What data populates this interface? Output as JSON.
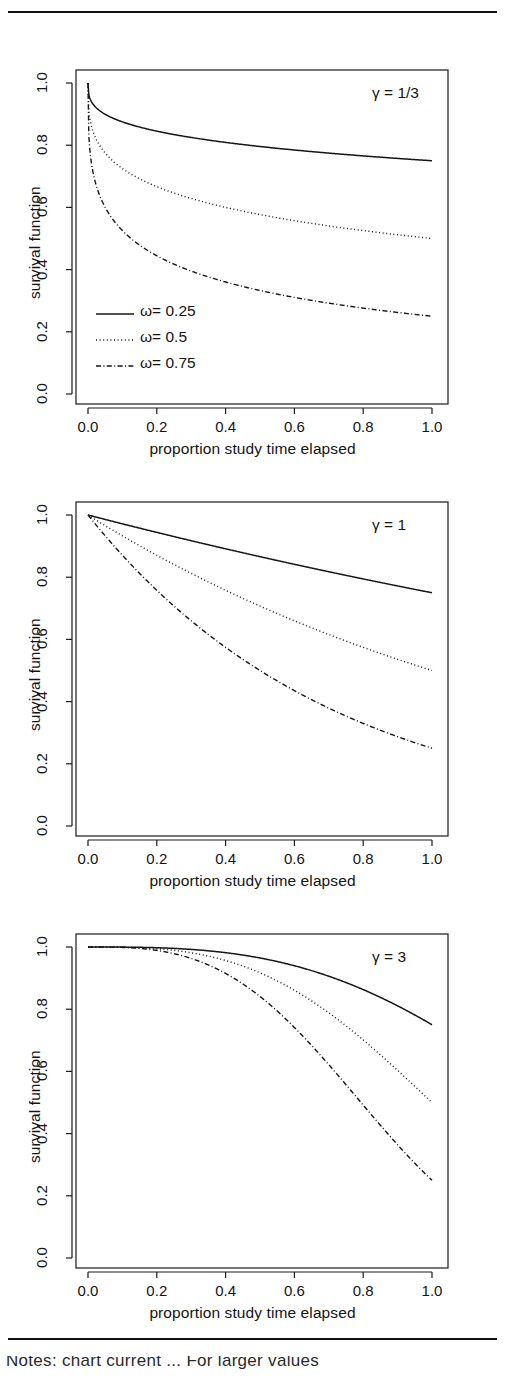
{
  "figure": {
    "panel_count": 3,
    "top_rule": "—",
    "bottom_rule": "—",
    "caption_fragment": "Notes: chart current ... For larger values"
  },
  "axes": {
    "xlabel": "proportion study time elapsed",
    "ylabel": "survival function",
    "xticks": [
      "0.0",
      "0.2",
      "0.4",
      "0.6",
      "0.8",
      "1.0"
    ],
    "yticks": [
      "0.0",
      "0.2",
      "0.4",
      "0.6",
      "0.8",
      "1.0"
    ]
  },
  "legend": {
    "entries": [
      {
        "label": "ω= 0.25",
        "style": "solid"
      },
      {
        "label": "ω= 0.5",
        "style": "dotted"
      },
      {
        "label": "ω= 0.75",
        "style": "dashdot"
      }
    ]
  },
  "panels": [
    {
      "annotation": "γ = 1/3",
      "gamma": 0.3333
    },
    {
      "annotation": "γ = 1",
      "gamma": 1
    },
    {
      "annotation": "γ = 3",
      "gamma": 3
    }
  ],
  "chart_data": [
    {
      "type": "line",
      "title": "γ = 1/3",
      "xlabel": "proportion study time elapsed",
      "ylabel": "survival function",
      "xlim": [
        0,
        1
      ],
      "ylim": [
        0,
        1
      ],
      "grid": false,
      "legend_position": "bottom-left",
      "x": [
        0,
        0.01,
        0.02,
        0.05,
        0.1,
        0.15,
        0.2,
        0.3,
        0.4,
        0.5,
        0.6,
        0.7,
        0.8,
        0.9,
        1.0
      ],
      "series": [
        {
          "name": "ω= 0.25",
          "style": "solid",
          "values": [
            1.0,
            0.941,
            0.927,
            0.905,
            0.884,
            0.871,
            0.861,
            0.846,
            0.834,
            0.824,
            0.815,
            0.807,
            0.8,
            0.794,
            0.75
          ]
        },
        {
          "name": "ω= 0.5",
          "style": "dotted",
          "values": [
            1.0,
            0.861,
            0.827,
            0.777,
            0.729,
            0.7,
            0.678,
            0.645,
            0.62,
            0.6,
            0.582,
            0.566,
            0.553,
            0.54,
            0.5
          ]
        },
        {
          "name": "ω= 0.75",
          "style": "dashdot",
          "values": [
            1.0,
            0.737,
            0.678,
            0.593,
            0.516,
            0.47,
            0.437,
            0.388,
            0.352,
            0.323,
            0.298,
            0.277,
            0.258,
            0.241,
            0.25
          ]
        }
      ]
    },
    {
      "type": "line",
      "title": "γ = 1",
      "xlabel": "proportion study time elapsed",
      "ylabel": "survival function",
      "xlim": [
        0,
        1
      ],
      "ylim": [
        0,
        1
      ],
      "grid": false,
      "legend_position": "none",
      "x": [
        0,
        0.1,
        0.2,
        0.3,
        0.4,
        0.5,
        0.6,
        0.7,
        0.8,
        0.9,
        1.0
      ],
      "series": [
        {
          "name": "ω= 0.25",
          "style": "solid",
          "values": [
            1.0,
            0.972,
            0.944,
            0.918,
            0.892,
            0.866,
            0.842,
            0.818,
            0.795,
            0.772,
            0.75
          ]
        },
        {
          "name": "ω= 0.5",
          "style": "dotted",
          "values": [
            1.0,
            0.933,
            0.871,
            0.812,
            0.758,
            0.707,
            0.66,
            0.616,
            0.574,
            0.536,
            0.5
          ]
        },
        {
          "name": "ω= 0.75",
          "style": "dashdot",
          "values": [
            1.0,
            0.871,
            0.758,
            0.66,
            0.574,
            0.5,
            0.435,
            0.379,
            0.33,
            0.287,
            0.25
          ]
        }
      ]
    },
    {
      "type": "line",
      "title": "γ = 3",
      "xlabel": "proportion study time elapsed",
      "ylabel": "survival function",
      "xlim": [
        0,
        1
      ],
      "ylim": [
        0,
        1
      ],
      "grid": false,
      "legend_position": "none",
      "x": [
        0,
        0.1,
        0.2,
        0.3,
        0.4,
        0.5,
        0.6,
        0.7,
        0.8,
        0.9,
        1.0
      ],
      "series": [
        {
          "name": "ω= 0.25",
          "style": "solid",
          "values": [
            1.0,
            1.0,
            0.998,
            0.992,
            0.982,
            0.965,
            0.94,
            0.905,
            0.859,
            0.81,
            0.75
          ]
        },
        {
          "name": "ω= 0.5",
          "style": "dotted",
          "values": [
            1.0,
            0.999,
            0.994,
            0.981,
            0.957,
            0.917,
            0.861,
            0.788,
            0.7,
            0.603,
            0.5
          ]
        },
        {
          "name": "ω= 0.75",
          "style": "dashdot",
          "values": [
            1.0,
            0.999,
            0.989,
            0.963,
            0.915,
            0.841,
            0.74,
            0.617,
            0.486,
            0.363,
            0.25
          ]
        }
      ]
    }
  ]
}
